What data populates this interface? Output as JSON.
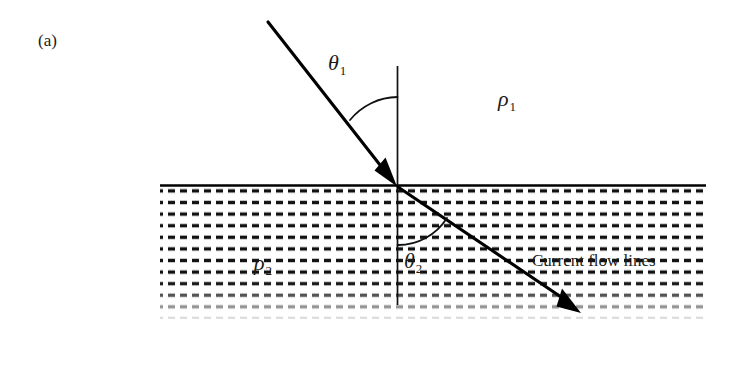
{
  "figure": {
    "panel_label": "(a)",
    "caption_text": "Current flow lines",
    "labels": {
      "theta1_symbol": "θ",
      "theta1_subscript": "1",
      "theta2_symbol": "θ",
      "theta2_subscript": "2",
      "rho1_symbol": "ρ",
      "rho1_subscript": "1",
      "rho2_symbol": "ρ",
      "rho2_subscript": "2"
    },
    "colors": {
      "ink": "#1a1a1a",
      "line": "#000000",
      "background": "#ffffff"
    }
  },
  "geometry": {
    "interface_y": 185,
    "interface_x_start": 160,
    "interface_x_end": 706,
    "incidence_point": [
      397,
      186
    ],
    "incident_ray_start": [
      268,
      22
    ],
    "refracted_ray_end": [
      581,
      313
    ],
    "normal_top": 66,
    "normal_bottom": 305,
    "hatch_bottom": 318
  }
}
